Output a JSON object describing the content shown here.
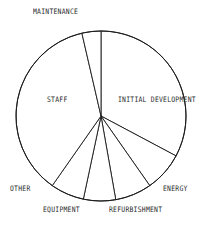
{
  "chart_data": {
    "type": "pie",
    "title": "",
    "subtitle": "",
    "xlabel": "",
    "ylabel": "",
    "grid": false,
    "legend_position": "none",
    "label_placement": "external",
    "style": "monochrome-line-art",
    "stroke_color": "#1a1a1a",
    "fill_color": "#ffffff",
    "start_angle_deg": 0,
    "direction": "clockwise",
    "categories": [
      "INITIAL DEVELOPMENT",
      "ENERGY",
      "REFURBISHMENT",
      "EQUIPMENT",
      "OTHER",
      "STAFF",
      "MAINTENANCE"
    ],
    "values": [
      32.8,
      7.5,
      6.9,
      6.1,
      6.4,
      36.7,
      3.6
    ],
    "value_unit": "percent",
    "slices": [
      {
        "label": "INITIAL DEVELOPMENT",
        "value": 32.8,
        "start_deg": 0,
        "end_deg": 118,
        "label_x": 118,
        "label_y": 97
      },
      {
        "label": "ENERGY",
        "value": 7.5,
        "start_deg": 118,
        "end_deg": 145,
        "label_x": 163,
        "label_y": 186
      },
      {
        "label": "REFURBISHMENT",
        "value": 6.9,
        "start_deg": 145,
        "end_deg": 170,
        "label_x": 109,
        "label_y": 207
      },
      {
        "label": "EQUIPMENT",
        "value": 6.1,
        "start_deg": 170,
        "end_deg": 192,
        "label_x": 43,
        "label_y": 207
      },
      {
        "label": "OTHER",
        "value": 6.4,
        "start_deg": 192,
        "end_deg": 215,
        "label_x": 10,
        "label_y": 186
      },
      {
        "label": "STAFF",
        "value": 36.7,
        "start_deg": 215,
        "end_deg": 347,
        "label_x": 47,
        "label_y": 97
      },
      {
        "label": "MAINTENANCE",
        "value": 3.6,
        "start_deg": 347,
        "end_deg": 360,
        "label_x": 33,
        "label_y": 9
      }
    ],
    "geometry": {
      "center_x": 101,
      "center_y": 116,
      "radius": 85
    }
  }
}
